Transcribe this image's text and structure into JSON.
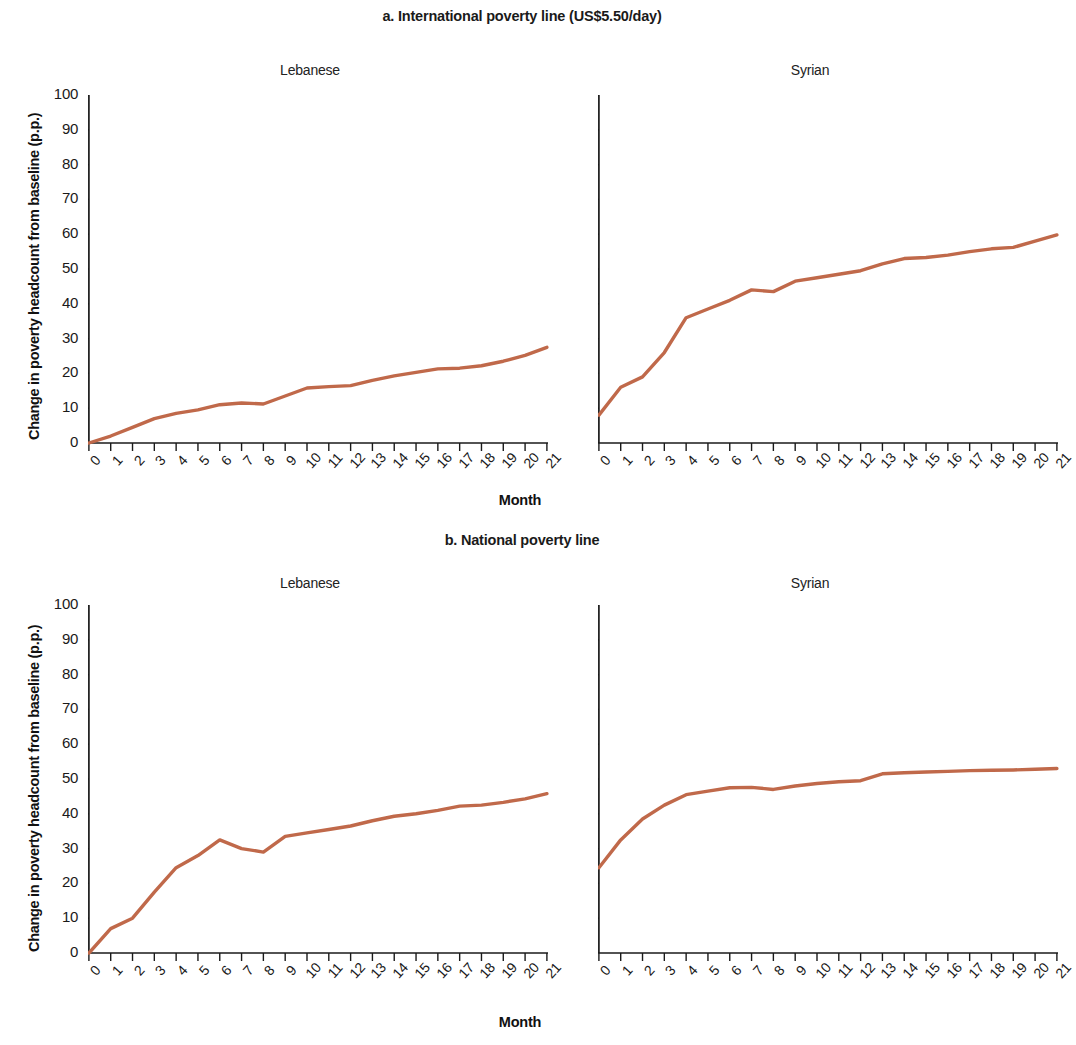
{
  "figure": {
    "panels": [
      {
        "id": "a",
        "title": "a. International poverty line (US$5.50/day)",
        "subpanels": [
          {
            "id": "a-lebanese",
            "title": "Lebanese"
          },
          {
            "id": "a-syrian",
            "title": "Syrian"
          }
        ]
      },
      {
        "id": "b",
        "title": "b. National poverty line",
        "subpanels": [
          {
            "id": "b-lebanese",
            "title": "Lebanese"
          },
          {
            "id": "b-syrian",
            "title": "Syrian"
          }
        ]
      }
    ],
    "axis": {
      "ylabel": "Change in poverty headcount from baseline (p.p.)",
      "xlabel": "Month",
      "yticks": [
        "100",
        "90",
        "80",
        "70",
        "60",
        "50",
        "40",
        "30",
        "20",
        "10",
        "0"
      ],
      "xticks": [
        "0",
        "1",
        "2",
        "3",
        "4",
        "5",
        "6",
        "7",
        "8",
        "9",
        "10",
        "11",
        "12",
        "13",
        "14",
        "15",
        "16",
        "17",
        "18",
        "19",
        "20",
        "21"
      ]
    },
    "colors": {
      "line": "#c0694a",
      "axis": "#1a1a1a",
      "text": "#1a1a1a",
      "background": "#ffffff"
    }
  },
  "chart_data": [
    {
      "type": "line",
      "id": "a-lebanese",
      "title": "a. International poverty line (US$5.50/day) — Lebanese",
      "xlabel": "Month",
      "ylabel": "Change in poverty headcount from baseline (p.p.)",
      "xlim": [
        0,
        21
      ],
      "ylim": [
        0,
        100
      ],
      "grid": false,
      "legend": "none",
      "x": [
        0,
        1,
        2,
        3,
        4,
        5,
        6,
        7,
        8,
        9,
        10,
        11,
        12,
        13,
        14,
        15,
        16,
        17,
        18,
        19,
        20,
        21
      ],
      "series": [
        {
          "name": "Lebanese",
          "color": "#c0694a",
          "values": [
            0.0,
            2.0,
            4.5,
            7.0,
            8.5,
            9.5,
            11.0,
            11.5,
            11.2,
            13.5,
            15.8,
            16.2,
            16.5,
            18.0,
            19.3,
            20.3,
            21.3,
            21.5,
            22.2,
            23.5,
            25.2,
            27.5
          ]
        }
      ]
    },
    {
      "type": "line",
      "id": "a-syrian",
      "title": "a. International poverty line (US$5.50/day) — Syrian",
      "xlabel": "Month",
      "ylabel": "Change in poverty headcount from baseline (p.p.)",
      "xlim": [
        0,
        21
      ],
      "ylim": [
        0,
        100
      ],
      "grid": false,
      "legend": "none",
      "x": [
        0,
        1,
        2,
        3,
        4,
        5,
        6,
        7,
        8,
        9,
        10,
        11,
        12,
        13,
        14,
        15,
        16,
        17,
        18,
        19,
        20,
        21
      ],
      "series": [
        {
          "name": "Syrian",
          "color": "#c0694a",
          "values": [
            8.0,
            16.0,
            19.0,
            26.0,
            36.0,
            38.5,
            41.0,
            44.0,
            43.5,
            46.5,
            47.5,
            48.5,
            49.5,
            51.5,
            53.0,
            53.3,
            54.0,
            55.0,
            55.8,
            56.2,
            58.0,
            59.8
          ]
        }
      ]
    },
    {
      "type": "line",
      "id": "b-lebanese",
      "title": "b. National poverty line — Lebanese",
      "xlabel": "Month",
      "ylabel": "Change in poverty headcount from baseline (p.p.)",
      "xlim": [
        0,
        21
      ],
      "ylim": [
        0,
        100
      ],
      "grid": false,
      "legend": "none",
      "x": [
        0,
        1,
        2,
        3,
        4,
        5,
        6,
        7,
        8,
        9,
        10,
        11,
        12,
        13,
        14,
        15,
        16,
        17,
        18,
        19,
        20,
        21
      ],
      "series": [
        {
          "name": "Lebanese",
          "color": "#c0694a",
          "values": [
            0.0,
            7.0,
            10.0,
            17.5,
            24.5,
            28.0,
            32.5,
            30.0,
            29.0,
            33.5,
            34.5,
            35.5,
            36.5,
            38.0,
            39.3,
            40.0,
            41.0,
            42.2,
            42.5,
            43.3,
            44.3,
            45.8
          ]
        }
      ]
    },
    {
      "type": "line",
      "id": "b-syrian",
      "title": "b. National poverty line — Syrian",
      "xlabel": "Month",
      "ylabel": "Change in poverty headcount from baseline (p.p.)",
      "xlim": [
        0,
        21
      ],
      "ylim": [
        0,
        100
      ],
      "grid": false,
      "legend": "none",
      "x": [
        0,
        1,
        2,
        3,
        4,
        5,
        6,
        7,
        8,
        9,
        10,
        11,
        12,
        13,
        14,
        15,
        16,
        17,
        18,
        19,
        20,
        21
      ],
      "series": [
        {
          "name": "Syrian",
          "color": "#c0694a",
          "values": [
            24.5,
            32.5,
            38.5,
            42.5,
            45.5,
            46.5,
            47.5,
            47.6,
            47.0,
            48.0,
            48.7,
            49.2,
            49.5,
            51.5,
            51.8,
            52.0,
            52.2,
            52.4,
            52.5,
            52.6,
            52.8,
            53.0
          ]
        }
      ]
    }
  ]
}
